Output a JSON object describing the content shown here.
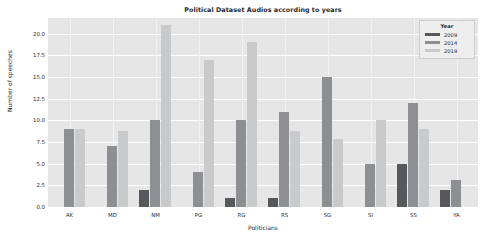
{
  "chart_data": {
    "type": "bar",
    "title": "Political Dataset Audios according to years",
    "xlabel": "Politicians",
    "ylabel": "Number of speeches",
    "categories": [
      "AK",
      "MD",
      "NM",
      "PG",
      "RG",
      "RS",
      "SG",
      "SI",
      "SS",
      "YA"
    ],
    "series": [
      {
        "name": "2009",
        "color": "#56585c",
        "values": [
          0,
          0,
          2,
          0,
          1,
          1,
          0,
          0,
          5,
          2
        ]
      },
      {
        "name": "2014",
        "color": "#8d8f93",
        "values": [
          9,
          7,
          10,
          4,
          10,
          11,
          15,
          5,
          12,
          3.1
        ]
      },
      {
        "name": "2019",
        "color": "#c8cacc",
        "values": [
          9,
          8.8,
          21,
          17,
          19,
          8.8,
          7.9,
          10,
          9,
          0
        ]
      }
    ],
    "ylim": [
      0,
      21.8
    ],
    "yticks": [
      "0.0",
      "2.5",
      "5.0",
      "7.5",
      "10.0",
      "12.5",
      "15.0",
      "17.5",
      "20.0"
    ],
    "ytick_values": [
      0,
      2.5,
      5,
      7.5,
      10,
      12.5,
      15,
      17.5,
      20
    ],
    "grid": true,
    "legend": {
      "title": "Year",
      "position": "upper right",
      "entries": [
        "2009",
        "2014",
        "2019"
      ]
    },
    "plot_background": "#e6e6e6",
    "figure_background": "#ffffff"
  }
}
